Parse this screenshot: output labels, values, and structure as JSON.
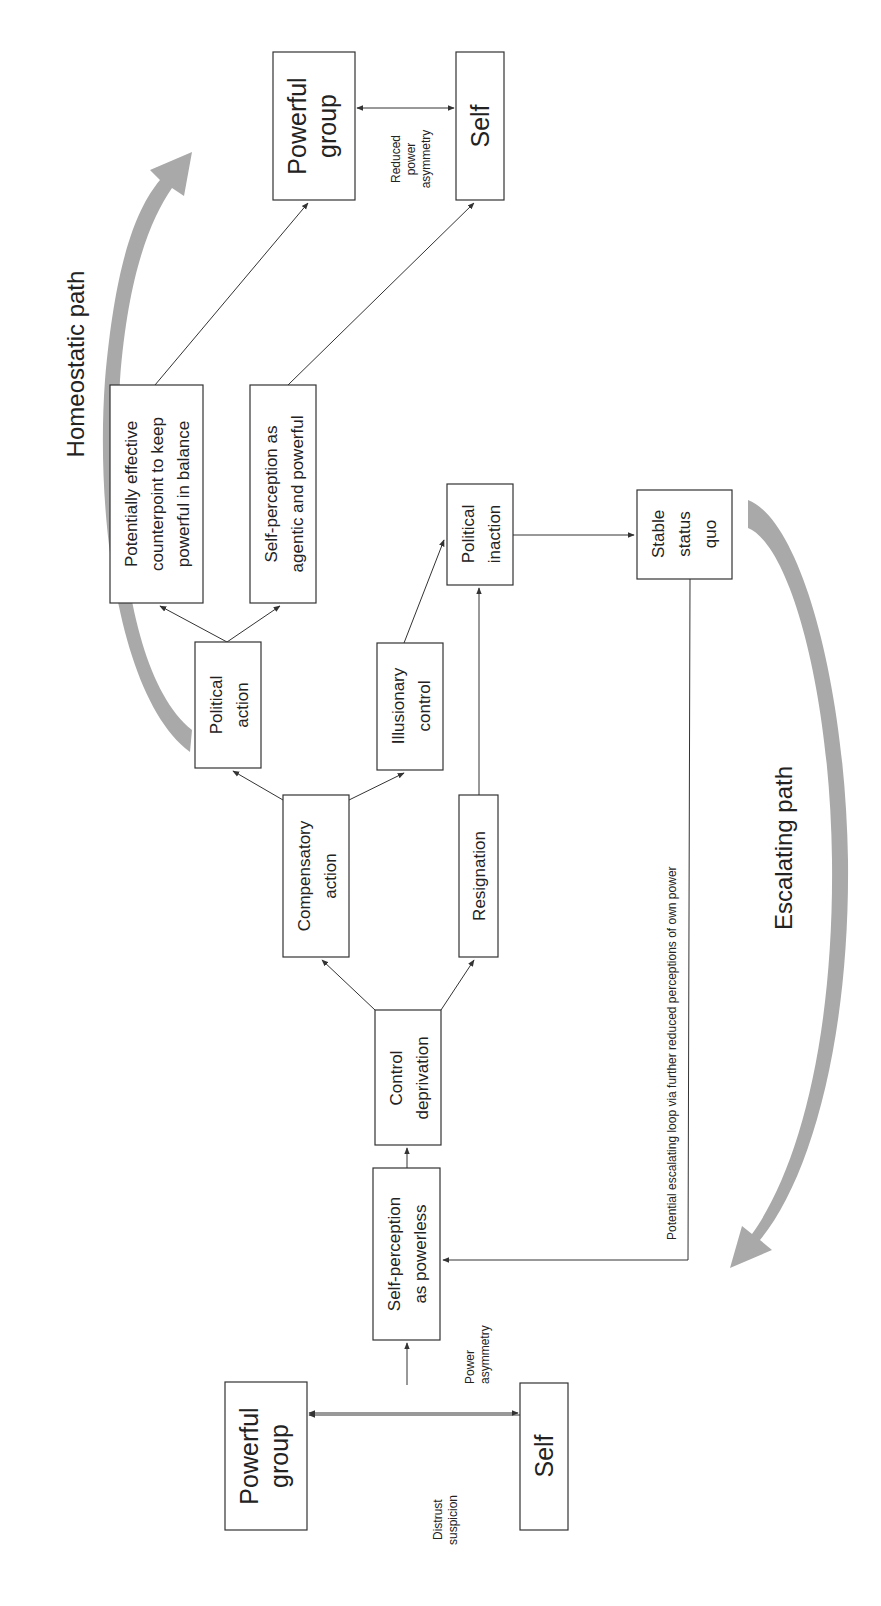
{
  "diagram": {
    "orientation": "rotated 90° counter-clockwise",
    "start": {
      "powerful_group": [
        "Powerful",
        "group"
      ],
      "self": [
        "Self"
      ],
      "edge_power_asymmetry": [
        "Power",
        "asymmetry"
      ],
      "edge_distrust": [
        "Distrust",
        "suspicion"
      ]
    },
    "nodes": {
      "self_perception_powerless": [
        "Self-perception",
        "as powerless"
      ],
      "control_deprivation": [
        "Control",
        "deprivation"
      ],
      "compensatory_action": [
        "Compensatory",
        "action"
      ],
      "resignation": [
        "Resignation"
      ],
      "political_action": [
        "Political",
        "action"
      ],
      "illusionary_control": [
        "Illusionary",
        "control"
      ],
      "political_inaction": [
        "Political",
        "inaction"
      ],
      "stable_status_quo": [
        "Stable",
        "status",
        "quo"
      ],
      "effective_counterpoint": [
        "Potentially effective",
        "counterpoint to keep",
        "powerful in balance"
      ],
      "self_perception_agentic": [
        "Self-perception as",
        "agentic and powerful"
      ]
    },
    "end": {
      "powerful_group": [
        "Powerful",
        "group"
      ],
      "self": [
        "Self"
      ],
      "edge_reduced": [
        "Reduced",
        "power",
        "asymmetry"
      ]
    },
    "loop_label": "Potential escalating loop via further reduced perceptions of own power",
    "paths": {
      "homeostatic": "Homeostatic path",
      "escalating": "Escalating path"
    },
    "colors": {
      "stroke": "#333333",
      "text": "#222222",
      "band": "#a9a9a9",
      "background": "#ffffff"
    }
  }
}
